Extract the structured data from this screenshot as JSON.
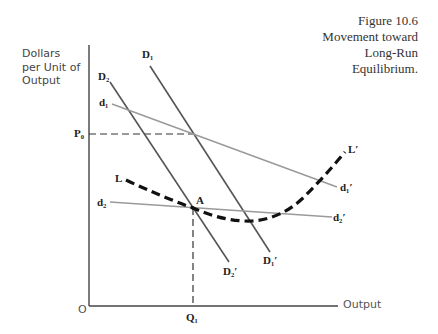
{
  "caption": {
    "line1": "Figure 10.6",
    "line2": "Movement toward",
    "line3": "Long-Run",
    "line4": "Equilibrium."
  },
  "axes": {
    "y_label_line1": "Dollars",
    "y_label_line2": "per Unit of",
    "y_label_line3": "Output",
    "x_label": "Output",
    "origin_label": "O",
    "price_tick_label": "P₀",
    "quantity_tick_label": "Q₁"
  },
  "curves": {
    "D1": {
      "label": "D₁",
      "end_label": "D₁′"
    },
    "D2": {
      "label": "D₂",
      "end_label": "D₂′"
    },
    "d1": {
      "label": "d₁",
      "end_label": "d₁′"
    },
    "d2": {
      "label": "d₂",
      "end_label": "d₂′"
    },
    "L": {
      "label": "L",
      "end_label": "L′"
    }
  },
  "point_label": "A",
  "colors": {
    "axis": "#444444",
    "steep_demand": "#555555",
    "flat_demand": "#999999",
    "long_run": "#111111"
  }
}
